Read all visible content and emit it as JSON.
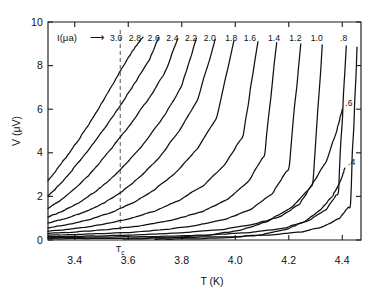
{
  "figure": {
    "background": "#ffffff",
    "line_color": "#111111",
    "tc_marker_color": "#555555"
  },
  "axes": {
    "x_title": "T  (K)",
    "y_title": "V (μV)",
    "x_ticks": [
      "3.4",
      "3.6",
      "3.8",
      "4.0",
      "4.2",
      "4.4"
    ],
    "x_tick_values": [
      3.4,
      3.6,
      3.8,
      4.0,
      4.2,
      4.4
    ],
    "y_ticks": [
      "0",
      "2",
      "4",
      "6",
      "8",
      "10"
    ],
    "y_tick_values": [
      0,
      2,
      4,
      6,
      8,
      10
    ],
    "xlim": [
      3.3,
      4.47
    ],
    "ylim": [
      0,
      10
    ]
  },
  "annotations": {
    "legend_prefix": "I(μa)",
    "legend_arrow": "⟶",
    "tc_label": "T",
    "tc_subscript": "c",
    "tc_value": 3.57
  },
  "chart_data": {
    "type": "line",
    "title": "",
    "xlabel": "T  (K)",
    "ylabel": "V (μV)",
    "xlim": [
      3.3,
      4.47
    ],
    "ylim": [
      0,
      10
    ],
    "grid": false,
    "legend_position": "top-inline-curve-labels",
    "series_parameter": "I (μA)",
    "tc": 3.57,
    "series": [
      {
        "name": "3.0",
        "label": "3.0",
        "label_x": 3.555,
        "x": [
          3.3,
          3.34,
          3.38,
          3.42,
          3.46,
          3.5,
          3.54,
          3.58,
          3.62,
          3.655
        ],
        "y": [
          2.72,
          3.35,
          4.0,
          4.7,
          5.45,
          6.25,
          7.1,
          7.95,
          8.75,
          9.3
        ]
      },
      {
        "name": "2.8",
        "label": "2.8",
        "label_x": 3.625,
        "x": [
          3.3,
          3.34,
          3.38,
          3.43,
          3.48,
          3.53,
          3.58,
          3.63,
          3.68,
          3.715
        ],
        "y": [
          2.02,
          2.5,
          3.05,
          3.8,
          4.6,
          5.45,
          6.35,
          7.3,
          8.3,
          9.3
        ]
      },
      {
        "name": "2.6",
        "label": "2.6",
        "label_x": 3.695,
        "x": [
          3.3,
          3.35,
          3.4,
          3.45,
          3.5,
          3.56,
          3.62,
          3.68,
          3.74,
          3.785
        ],
        "y": [
          1.45,
          1.85,
          2.35,
          2.95,
          3.65,
          4.55,
          5.5,
          6.55,
          7.75,
          9.25
        ]
      },
      {
        "name": "2.4",
        "label": "2.4",
        "label_x": 3.765,
        "x": [
          3.3,
          3.36,
          3.42,
          3.48,
          3.54,
          3.6,
          3.67,
          3.74,
          3.8,
          3.855
        ],
        "y": [
          1.05,
          1.35,
          1.75,
          2.25,
          2.85,
          3.6,
          4.6,
          5.8,
          7.05,
          9.25
        ]
      },
      {
        "name": "2.2",
        "label": "2.2",
        "label_x": 3.835,
        "x": [
          3.3,
          3.37,
          3.44,
          3.51,
          3.58,
          3.65,
          3.72,
          3.79,
          3.86,
          3.925
        ],
        "y": [
          0.78,
          1.0,
          1.3,
          1.7,
          2.25,
          2.95,
          3.85,
          5.0,
          6.45,
          9.2
        ]
      },
      {
        "name": "2.0",
        "label": "2.0",
        "label_x": 3.905,
        "x": [
          3.3,
          3.38,
          3.46,
          3.54,
          3.62,
          3.7,
          3.78,
          3.86,
          3.93,
          3.995
        ],
        "y": [
          0.55,
          0.72,
          0.95,
          1.28,
          1.72,
          2.32,
          3.12,
          4.2,
          5.6,
          9.15
        ]
      },
      {
        "name": "1.8",
        "label": "1.8",
        "label_x": 3.985,
        "x": [
          3.3,
          3.4,
          3.5,
          3.6,
          3.7,
          3.79,
          3.88,
          3.96,
          4.03,
          4.085
        ],
        "y": [
          0.4,
          0.52,
          0.7,
          0.96,
          1.33,
          1.82,
          2.5,
          3.45,
          4.8,
          9.1
        ]
      },
      {
        "name": "1.6",
        "label": "1.6",
        "label_x": 4.055,
        "x": [
          3.3,
          3.42,
          3.54,
          3.66,
          3.78,
          3.88,
          3.97,
          4.05,
          4.11,
          4.155
        ],
        "y": [
          0.3,
          0.38,
          0.5,
          0.68,
          0.96,
          1.32,
          1.85,
          2.7,
          3.95,
          9.05
        ]
      },
      {
        "name": "1.4",
        "label": "1.4",
        "label_x": 4.145,
        "x": [
          3.3,
          3.45,
          3.6,
          3.74,
          3.86,
          3.97,
          4.06,
          4.14,
          4.2,
          4.245
        ],
        "y": [
          0.22,
          0.27,
          0.35,
          0.48,
          0.68,
          0.98,
          1.42,
          2.15,
          3.3,
          9.0
        ]
      },
      {
        "name": "1.2",
        "label": "1.2",
        "label_x": 4.225,
        "x": [
          3.3,
          3.48,
          3.66,
          3.82,
          3.96,
          4.07,
          4.17,
          4.24,
          4.29,
          4.325
        ],
        "y": [
          0.15,
          0.19,
          0.25,
          0.35,
          0.5,
          0.72,
          1.08,
          1.65,
          2.6,
          8.95
        ]
      },
      {
        "name": "1.0",
        "label": "1.0",
        "label_x": 4.305,
        "x": [
          3.3,
          3.52,
          3.74,
          3.92,
          4.06,
          4.18,
          4.27,
          4.34,
          4.385,
          4.415
        ],
        "y": [
          0.1,
          0.13,
          0.17,
          0.24,
          0.35,
          0.54,
          0.86,
          1.4,
          2.2,
          8.9
        ]
      },
      {
        "name": ".8",
        "label": ".8",
        "label_x": 4.405,
        "x": [
          3.3,
          3.58,
          3.82,
          4.0,
          4.14,
          4.25,
          4.33,
          4.39,
          4.43,
          4.455
        ],
        "y": [
          0.06,
          0.08,
          0.11,
          0.16,
          0.24,
          0.38,
          0.62,
          1.0,
          1.6,
          8.85
        ]
      },
      {
        "name": ".6",
        "label": ".6",
        "label_x": 4.4,
        "x": [
          3.58,
          3.75,
          3.9,
          4.02,
          4.12,
          4.21,
          4.28,
          4.34,
          4.38,
          4.4
        ],
        "y": [
          0.05,
          0.1,
          0.22,
          0.45,
          0.85,
          1.5,
          2.4,
          3.6,
          5.05,
          6.0
        ]
      },
      {
        "name": ".4",
        "label": ".4",
        "label_x": 4.4,
        "x": [
          3.7,
          3.86,
          3.99,
          4.1,
          4.19,
          4.26,
          4.32,
          4.365,
          4.395,
          4.41
        ],
        "y": [
          0.03,
          0.06,
          0.12,
          0.25,
          0.48,
          0.85,
          1.4,
          2.05,
          2.75,
          3.3
        ]
      }
    ]
  }
}
